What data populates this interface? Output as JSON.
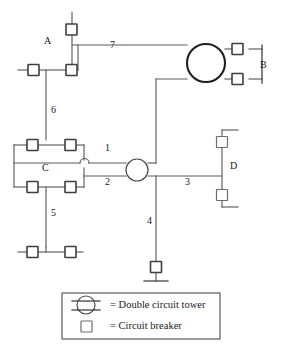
{
  "diagram": {
    "buses": [
      {
        "id": "A",
        "label": "A",
        "x": 48,
        "y": 41
      },
      {
        "id": "B",
        "label": "B",
        "x": 264,
        "y": 65
      },
      {
        "id": "C",
        "label": "C",
        "x": 45,
        "y": 168
      },
      {
        "id": "D",
        "label": "D",
        "x": 232,
        "y": 166
      }
    ],
    "lines": [
      {
        "id": "1",
        "label": "1",
        "x": 108,
        "y": 148
      },
      {
        "id": "2",
        "label": "2",
        "x": 108,
        "y": 181
      },
      {
        "id": "3",
        "label": "3",
        "x": 187,
        "y": 181
      },
      {
        "id": "4",
        "label": "4",
        "x": 150,
        "y": 220
      },
      {
        "id": "5",
        "label": "5",
        "x": 55,
        "y": 212
      },
      {
        "id": "6",
        "label": "6",
        "x": 55,
        "y": 110
      },
      {
        "id": "7",
        "label": "7",
        "x": 113,
        "y": 45
      }
    ],
    "towers": [
      {
        "name": "double-circuit-tower-b",
        "cx": 206,
        "cy": 63,
        "r": 19
      },
      {
        "name": "double-circuit-tower-line12",
        "cx": 137,
        "cy": 163,
        "r": 11
      }
    ],
    "breakers": [
      {
        "name": "breaker-a-top",
        "x": 66,
        "y": 24
      },
      {
        "name": "breaker-a-left",
        "x": 28,
        "y": 70
      },
      {
        "name": "breaker-a-right",
        "x": 66,
        "y": 70
      },
      {
        "name": "breaker-b-top",
        "x": 240,
        "y": 49
      },
      {
        "name": "breaker-b-bottom",
        "x": 240,
        "y": 79
      },
      {
        "name": "breaker-c-tl",
        "x": 27,
        "y": 140
      },
      {
        "name": "breaker-c-tr",
        "x": 65,
        "y": 140
      },
      {
        "name": "breaker-c-bl",
        "x": 27,
        "y": 182
      },
      {
        "name": "breaker-c-br",
        "x": 65,
        "y": 182
      },
      {
        "name": "breaker-5-left",
        "x": 27,
        "y": 247
      },
      {
        "name": "breaker-5-right",
        "x": 65,
        "y": 247
      },
      {
        "name": "breaker-d-top",
        "x": 222,
        "y": 137
      },
      {
        "name": "breaker-d-bottom",
        "x": 222,
        "y": 190
      },
      {
        "name": "breaker-line4-end",
        "x": 160,
        "y": 262
      }
    ]
  },
  "legend": {
    "name": "legend-panel",
    "items": [
      {
        "symbol": "double-circuit-tower-icon",
        "text": "= Double circuit tower"
      },
      {
        "symbol": "circuit-breaker-icon",
        "text": "= Circuit breaker"
      }
    ]
  },
  "colors": {
    "wire": "#5c5c5c",
    "wire_dark": "#3a3a3a",
    "breaker_stroke": "#3f3f3f",
    "tower_stroke": "#1f1f1f",
    "text": "#1f1f1f",
    "background": "#ffffff"
  }
}
